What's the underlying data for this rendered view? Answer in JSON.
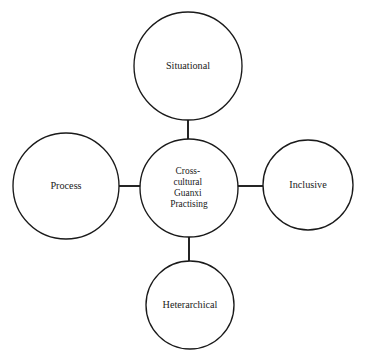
{
  "diagram": {
    "type": "hub-and-spoke",
    "background_color": "#ffffff",
    "stroke_color": "#1a1a1a",
    "text_color": "#1a1a1a",
    "center": {
      "id": "center-node",
      "label": "Cross-cultural Guanxi Practising",
      "lines": [
        "Cross-",
        "cultural",
        "Guanxi",
        "Practising"
      ],
      "cx": 189,
      "cy": 188,
      "r": 49
    },
    "satellites": [
      {
        "id": "node-situational",
        "label": "Situational",
        "position": "top",
        "cx": 188,
        "cy": 66,
        "r": 54
      },
      {
        "id": "node-process",
        "label": "Process",
        "position": "left",
        "cx": 66,
        "cy": 186,
        "r": 53
      },
      {
        "id": "node-inclusive",
        "label": "Inclusive",
        "position": "right",
        "cx": 308,
        "cy": 185,
        "r": 45
      },
      {
        "id": "node-heterarchical",
        "label": "Heterarchical",
        "position": "bottom",
        "cx": 190,
        "cy": 305,
        "r": 44
      }
    ],
    "connectors": [
      {
        "id": "connector-center-situational",
        "from": "center-node",
        "to": "node-situational",
        "x1": 188,
        "y1": 112,
        "x2": 188,
        "y2": 140
      },
      {
        "id": "connector-center-process",
        "from": "center-node",
        "to": "node-process",
        "x1": 111,
        "y1": 186,
        "x2": 141,
        "y2": 186
      },
      {
        "id": "connector-center-inclusive",
        "from": "center-node",
        "to": "node-inclusive",
        "x1": 238,
        "y1": 186,
        "x2": 263,
        "y2": 186
      },
      {
        "id": "connector-center-heterarchical",
        "from": "center-node",
        "to": "node-heterarchical",
        "x1": 189,
        "y1": 236,
        "x2": 189,
        "y2": 262
      }
    ]
  }
}
